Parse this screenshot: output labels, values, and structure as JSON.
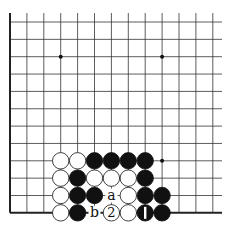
{
  "board": {
    "description": "Go problem diagram, lower-left corner view",
    "columns": 13,
    "rows": 12,
    "origin_x": 10,
    "origin_y": 22,
    "spacing_x": 16.9,
    "spacing_y": 17.35,
    "line_extend_right": 222,
    "left_edge": true,
    "bottom_edge": true,
    "star_points": [
      [
        3,
        2
      ],
      [
        9,
        2
      ],
      [
        9,
        8
      ]
    ],
    "stones": [
      {
        "col": 3,
        "row": 8,
        "color": "white"
      },
      {
        "col": 4,
        "row": 8,
        "color": "white"
      },
      {
        "col": 5,
        "row": 8,
        "color": "black"
      },
      {
        "col": 6,
        "row": 8,
        "color": "black"
      },
      {
        "col": 7,
        "row": 8,
        "color": "black"
      },
      {
        "col": 8,
        "row": 8,
        "color": "black"
      },
      {
        "col": 3,
        "row": 9,
        "color": "white"
      },
      {
        "col": 4,
        "row": 9,
        "color": "black"
      },
      {
        "col": 5,
        "row": 9,
        "color": "white"
      },
      {
        "col": 6,
        "row": 9,
        "color": "white"
      },
      {
        "col": 7,
        "row": 9,
        "color": "white"
      },
      {
        "col": 8,
        "row": 9,
        "color": "black"
      },
      {
        "col": 3,
        "row": 10,
        "color": "white"
      },
      {
        "col": 4,
        "row": 10,
        "color": "black"
      },
      {
        "col": 5,
        "row": 10,
        "color": "black"
      },
      {
        "col": 7,
        "row": 10,
        "color": "white"
      },
      {
        "col": 8,
        "row": 10,
        "color": "black"
      },
      {
        "col": 9,
        "row": 10,
        "color": "black"
      },
      {
        "col": 3,
        "row": 11,
        "color": "white"
      },
      {
        "col": 4,
        "row": 11,
        "color": "black"
      },
      {
        "col": 6,
        "row": 11,
        "color": "white",
        "label": "2"
      },
      {
        "col": 7,
        "row": 11,
        "color": "white"
      },
      {
        "col": 8,
        "row": 11,
        "color": "black",
        "label": "1"
      },
      {
        "col": 9,
        "row": 11,
        "color": "black"
      }
    ],
    "labels": [
      {
        "col": 6,
        "row": 10,
        "text": "a"
      },
      {
        "col": 5,
        "row": 11,
        "text": "b"
      }
    ]
  },
  "colors": {
    "line": "#333333",
    "edge": "#222222",
    "black_stone": "#111111",
    "white_stone": "#ffffff"
  }
}
